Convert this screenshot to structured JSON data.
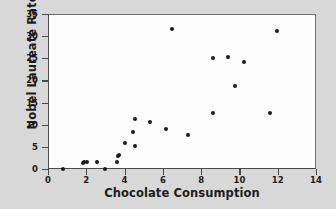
{
  "chart_data": {
    "type": "scatter",
    "title": "",
    "xlabel": "Chocolate Consumption",
    "ylabel": "Nobel Laureate Rate",
    "xlim": [
      0,
      14
    ],
    "ylim": [
      0,
      35
    ],
    "xticks": [
      0,
      2,
      4,
      6,
      8,
      10,
      12,
      14
    ],
    "yticks": [
      0,
      5,
      10,
      15,
      20,
      25,
      30,
      35
    ],
    "grid": false,
    "legend": null,
    "marker": {
      "shape": "circle",
      "color": "#1a1a1a",
      "size": 4
    },
    "points": [
      {
        "x": 0.75,
        "y": 0.2
      },
      {
        "x": 1.8,
        "y": 1.5
      },
      {
        "x": 1.85,
        "y": 1.9
      },
      {
        "x": 2.0,
        "y": 1.9
      },
      {
        "x": 2.5,
        "y": 1.9
      },
      {
        "x": 2.95,
        "y": 0.2
      },
      {
        "x": 3.55,
        "y": 1.8
      },
      {
        "x": 3.6,
        "y": 3.2
      },
      {
        "x": 3.65,
        "y": 3.4
      },
      {
        "x": 3.95,
        "y": 6.2
      },
      {
        "x": 4.4,
        "y": 8.6
      },
      {
        "x": 4.5,
        "y": 11.5
      },
      {
        "x": 4.5,
        "y": 5.5
      },
      {
        "x": 5.3,
        "y": 10.8
      },
      {
        "x": 6.1,
        "y": 9.2
      },
      {
        "x": 6.4,
        "y": 31.9
      },
      {
        "x": 7.25,
        "y": 7.8
      },
      {
        "x": 8.55,
        "y": 12.8
      },
      {
        "x": 8.55,
        "y": 25.4
      },
      {
        "x": 9.35,
        "y": 25.5
      },
      {
        "x": 9.7,
        "y": 18.9
      },
      {
        "x": 10.2,
        "y": 24.3
      },
      {
        "x": 11.55,
        "y": 12.8
      },
      {
        "x": 11.9,
        "y": 31.5
      }
    ]
  },
  "axis": {
    "y_tick_labels": [
      "0",
      "5",
      "10",
      "15",
      "20",
      "25",
      "30",
      "35"
    ],
    "x_tick_labels": [
      "0",
      "2",
      "4",
      "6",
      "8",
      "10",
      "12",
      "14"
    ]
  }
}
